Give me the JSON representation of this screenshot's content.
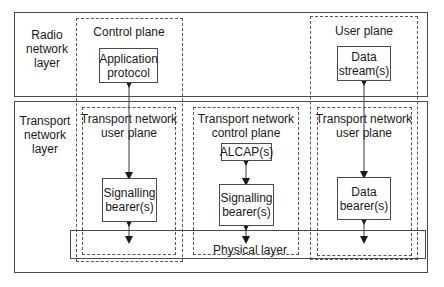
{
  "diagram": {
    "layers": {
      "radio": "Radio\nnetwork\nlayer",
      "transport": "Transport\nnetwork\nlayer"
    },
    "planes": {
      "control": "Control plane",
      "user": "User plane",
      "tn_user_left": "Transport network\nuser plane",
      "tn_control": "Transport network\ncontrol plane",
      "tn_user_right": "Transport network\nuser plane"
    },
    "boxes": {
      "application_protocol": "Application\nprotocol",
      "data_streams": "Data\nstream(s)",
      "signalling_bearer_left": "Signalling\nbearer(s)",
      "alcap": "ALCAP(s)",
      "signalling_bearer_mid": "Signalling\nbearer(s)",
      "data_bearer": "Data\nbearer(s)"
    },
    "physical_layer": "Physical layer",
    "colors": {
      "line": "#4a4a4a",
      "text": "#1a1a1a",
      "background": "#ffffff"
    }
  }
}
